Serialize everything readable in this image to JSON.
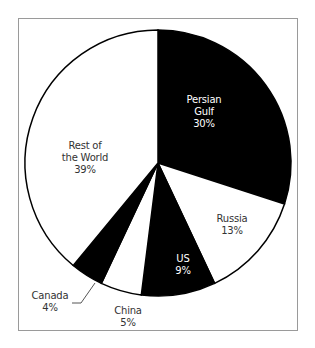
{
  "chart_data": {
    "type": "pie",
    "title": "",
    "start_angle_deg": 0,
    "direction": "clockwise",
    "categories": [
      "Persian Gulf",
      "Russia",
      "US",
      "China",
      "Canada",
      "Rest of the World"
    ],
    "values": [
      30,
      13,
      9,
      5,
      4,
      39
    ],
    "unit": "%",
    "slice_colors": [
      "#000000",
      "#ffffff",
      "#000000",
      "#ffffff",
      "#000000",
      "#ffffff"
    ],
    "labels": [
      {
        "lines": [
          "Persian",
          "Gulf",
          "30%"
        ],
        "x": 204,
        "y": 94,
        "color": "#ffffff"
      },
      {
        "lines": [
          "Russia",
          "13%"
        ],
        "x": 232,
        "y": 213,
        "color": "#333333"
      },
      {
        "lines": [
          "US",
          "9%"
        ],
        "x": 183,
        "y": 253,
        "color": "#ffffff"
      },
      {
        "lines": [
          "China",
          "5%"
        ],
        "x": 128,
        "y": 305,
        "color": "#333333"
      },
      {
        "lines": [
          "Canada",
          "4%"
        ],
        "x": 50,
        "y": 290,
        "color": "#333333"
      },
      {
        "lines": [
          "Rest of",
          "the World",
          "39%"
        ],
        "x": 85,
        "y": 140,
        "color": "#333333"
      }
    ],
    "leader_line": {
      "for": "Canada",
      "points": [
        [
          95,
          283
        ],
        [
          81,
          303
        ],
        [
          72,
          303
        ]
      ]
    },
    "legend": "none"
  },
  "geometry": {
    "cx": 158,
    "cy": 163,
    "r": 133
  },
  "colors": {
    "outline": "#000000",
    "frame": "#9a9a9a",
    "text": "#333333"
  }
}
